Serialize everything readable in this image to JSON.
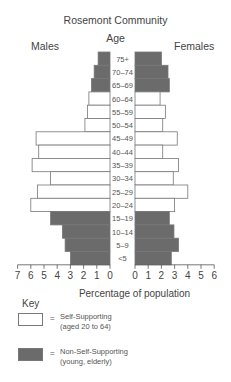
{
  "chart_data": {
    "type": "bar",
    "subtype": "population-pyramid",
    "title": "Rosemont Community",
    "center_axis_label": "Age",
    "left_label": "Males",
    "right_label": "Females",
    "xlabel": "Percentage of population",
    "categories": [
      "75+",
      "70–74",
      "65–69",
      "60–64",
      "55–59",
      "50–54",
      "45–49",
      "40–44",
      "35–39",
      "30–34",
      "25–29",
      "20–24",
      "15–19",
      "10–14",
      "5–9",
      "<5"
    ],
    "series": [
      {
        "name": "Males",
        "values": [
          0.9,
          1.2,
          1.4,
          1.6,
          1.7,
          1.9,
          5.6,
          5.4,
          5.9,
          4.5,
          5.5,
          6.0,
          4.5,
          3.6,
          3.4,
          3.0
        ]
      },
      {
        "name": "Females",
        "values": [
          2.0,
          2.5,
          2.6,
          1.9,
          2.3,
          2.1,
          3.2,
          2.1,
          3.3,
          2.9,
          4.0,
          3.0,
          2.6,
          2.95,
          3.3,
          2.75
        ]
      }
    ],
    "category_type": [
      "non-self-supporting",
      "non-self-supporting",
      "non-self-supporting",
      "self-supporting",
      "self-supporting",
      "self-supporting",
      "self-supporting",
      "self-supporting",
      "self-supporting",
      "self-supporting",
      "self-supporting",
      "self-supporting",
      "non-self-supporting",
      "non-self-supporting",
      "non-self-supporting",
      "non-self-supporting"
    ],
    "male_axis_ticks": [
      "7",
      "6",
      "5",
      "4",
      "3",
      "2",
      "1",
      "0"
    ],
    "female_axis_ticks": [
      "0",
      "1",
      "2",
      "3",
      "4",
      "5",
      "6"
    ],
    "male_xlim": [
      7,
      0
    ],
    "female_xlim": [
      0,
      6
    ],
    "grid": false,
    "legend": {
      "title": "Key",
      "position": "bottom-left",
      "entries": [
        {
          "symbol": "=",
          "label": "Self-Supporting",
          "sublabel": "(aged 20 to 64)",
          "color": "#ffffff"
        },
        {
          "symbol": "=",
          "label": "Non-Self-Supporting",
          "sublabel": "(young, elderly)",
          "color": "#6b6b6b"
        }
      ]
    }
  },
  "colors": {
    "self_supporting": "#ffffff",
    "non_self_supporting": "#6b6b6b",
    "outline": "#777777",
    "text": "#444444"
  }
}
